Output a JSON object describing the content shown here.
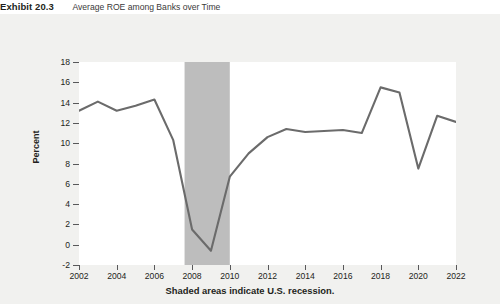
{
  "title": {
    "exhibit_number": "Exhibit 20.3",
    "caption": "Average ROE among Banks over Time"
  },
  "figure": {
    "x_caption": "Shaded areas indicate U.S. recession.",
    "panel_background": "#f1f1ef",
    "plot_background": "#ffffff",
    "line_color": "#6b6b6b",
    "shade_color": "#bdbdbd",
    "axis_color": "#58585a"
  },
  "chart_data": {
    "type": "line",
    "title": "Average ROE among Banks over Time",
    "xlabel": "",
    "ylabel": "Percent",
    "xlim": [
      2002,
      2022
    ],
    "ylim": [
      -2,
      18
    ],
    "grid": false,
    "legend": "none",
    "x_tick_labels": [
      "2002",
      "2004",
      "2006",
      "2008",
      "2010",
      "2012",
      "2014",
      "2016",
      "2018",
      "2020",
      "2022"
    ],
    "x_ticks": [
      2002,
      2004,
      2006,
      2008,
      2010,
      2012,
      2014,
      2016,
      2018,
      2020,
      2022
    ],
    "y_tick_labels": [
      "18",
      "16",
      "14",
      "12",
      "10",
      "8",
      "6",
      "4",
      "2",
      "0",
      "-2"
    ],
    "y_ticks": [
      18,
      16,
      14,
      12,
      10,
      8,
      6,
      4,
      2,
      0,
      -2
    ],
    "x": [
      2002,
      2003,
      2004,
      2005,
      2006,
      2007,
      2008,
      2009,
      2010,
      2011,
      2012,
      2013,
      2014,
      2015,
      2016,
      2017,
      2018,
      2019,
      2020,
      2021,
      2022
    ],
    "values": [
      13.2,
      14.1,
      13.2,
      13.7,
      14.3,
      10.3,
      1.5,
      -0.6,
      6.7,
      9.0,
      10.6,
      11.4,
      11.1,
      11.2,
      11.3,
      11.0,
      15.5,
      15.0,
      7.5,
      12.7,
      12.1
    ],
    "series": [
      {
        "name": "Average ROE among Banks",
        "values": [
          13.2,
          14.1,
          13.2,
          13.7,
          14.3,
          10.3,
          1.5,
          -0.6,
          6.7,
          9.0,
          10.6,
          11.4,
          11.1,
          11.2,
          11.3,
          11.0,
          15.5,
          15.0,
          7.5,
          12.7,
          12.1
        ]
      }
    ],
    "shaded_regions": [
      {
        "label": "U.S. recession",
        "x_start": 2007.6,
        "x_end": 2010.0
      }
    ],
    "annotations": [
      "Shaded areas indicate U.S. recession."
    ]
  }
}
